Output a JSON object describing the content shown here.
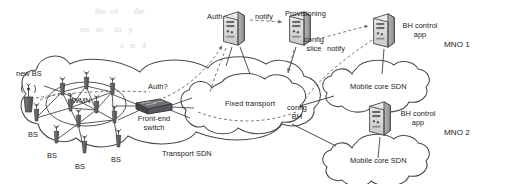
{
  "figure": {
    "type": "network-architecture-diagram"
  },
  "domains": {
    "transport_sdn": "Transport SDN",
    "fixed_transport": "Fixed transport",
    "wmn": "WMN",
    "mno1": "MNO 1",
    "mno2": "MNO 2",
    "mobile_core_sdn_1": "Mobile core SDN",
    "mobile_core_sdn_2": "Mobile core SDN"
  },
  "nodes": {
    "auth": "Auth",
    "provisioning": "Provisioning",
    "bh_control_app_1": "BH control\napp",
    "bh_control_app_2": "BH control\napp",
    "front_end_switch": "Front-end\nswitch",
    "new_bs": "new BS"
  },
  "base_stations": [
    {
      "label": "BS",
      "x": 28,
      "y": 131
    },
    {
      "label": "BS",
      "x": 47,
      "y": 152
    },
    {
      "label": "BS",
      "x": 75,
      "y": 163
    },
    {
      "label": "BS",
      "x": 111,
      "y": 156
    }
  ],
  "edge_labels": {
    "notify_1": "notify",
    "notify_2": "notify",
    "auth_query": "Auth?",
    "config_slice": "config\nslice",
    "config_bh": "config\nBH"
  },
  "icons": {
    "server": "server-tower-icon",
    "switch": "network-switch-icon",
    "base_station": "base-station-antenna-icon",
    "wireless": "wireless-signal-icon",
    "cloud": "cloud-icon"
  },
  "colors": {
    "stroke": "#3a3a3a",
    "dashed": "#6b6b6b",
    "fill_light": "#e8e8e8",
    "fill_mid": "#9a9a9a",
    "fill_dark": "#55555a",
    "text": "#1a1a1a",
    "background": "#ffffff"
  },
  "scan_artifacts": {
    "bleed_line_1": "the  of       the",
    "bleed_line_2": "on   as     to   y",
    "bleed_line_3": "s   n   d"
  }
}
